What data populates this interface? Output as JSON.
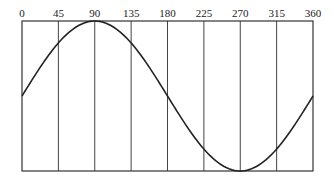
{
  "chart_data": {
    "type": "line",
    "title": "",
    "xlabel": "",
    "ylabel": "",
    "x_ticks": [
      0,
      45,
      90,
      135,
      180,
      225,
      270,
      315,
      360
    ],
    "x_tick_labels": [
      "0",
      "45",
      "90",
      "135",
      "180",
      "225",
      "270",
      "315",
      "360"
    ],
    "xlim": [
      0,
      360
    ],
    "ylim": [
      -1,
      1
    ],
    "grid": {
      "vertical": true,
      "horizontal": false
    },
    "legend": null,
    "series": [
      {
        "name": "sine",
        "function": "sin(x)",
        "x": [
          0,
          45,
          90,
          135,
          180,
          225,
          270,
          315,
          360
        ],
        "values": [
          0,
          0.707,
          1,
          0.707,
          0,
          -0.707,
          -1,
          -0.707,
          0
        ]
      }
    ]
  },
  "colors": {
    "frame": "#333333",
    "grid": "#444444",
    "curve": "#222222",
    "background": "#ffffff"
  }
}
